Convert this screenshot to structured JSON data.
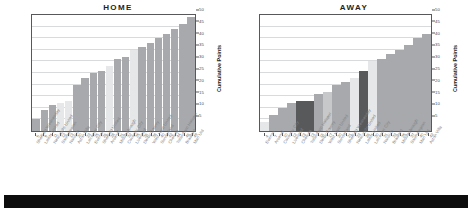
{
  "charts": {
    "home": {
      "title": "HOME",
      "ylabel": "Cumulative Points"
    },
    "away": {
      "title": "AWAY",
      "ylabel": "Cumulative Points"
    }
  },
  "chart_data": [
    {
      "type": "bar",
      "title": "HOME",
      "xlabel": "",
      "ylabel": "Cumulative Points",
      "ylim": [
        0,
        50
      ],
      "yticks": [
        5,
        10,
        15,
        20,
        25,
        30,
        35,
        40,
        45,
        50
      ],
      "grid": true,
      "legend": "none",
      "categories": [
        "Sheffield Wednesday",
        "Leeds United",
        "Newcastle United",
        "Southampton",
        "Norwich",
        "Aston Villa",
        "Leicester City",
        "Everton",
        "Sheffield United",
        "Arsenal",
        "Middlesbrough",
        "Coventry City",
        "Liverpool",
        "Derby County",
        "West Ham United",
        "Sunderland",
        "Chelsea",
        "Tottenham Hotspur",
        "Bradford",
        "Man Utd"
      ],
      "values": [
        5,
        9,
        11,
        12,
        13,
        20,
        23,
        25,
        26,
        28,
        31,
        32,
        35,
        36,
        38,
        40,
        42,
        44,
        46,
        49
      ],
      "bar_colors": [
        "#a7a9ac",
        "#a7a9ac",
        "#a7a9ac",
        "#e6e7e8",
        "#e6e7e8",
        "#a7a9ac",
        "#a7a9ac",
        "#a7a9ac",
        "#a7a9ac",
        "#e6e7e8",
        "#a7a9ac",
        "#a7a9ac",
        "#e6e7e8",
        "#a7a9ac",
        "#a7a9ac",
        "#a7a9ac",
        "#a7a9ac",
        "#a7a9ac",
        "#a7a9ac",
        "#a7a9ac"
      ]
    },
    {
      "type": "bar",
      "title": "AWAY",
      "xlabel": "",
      "ylabel": "Cumulative Points",
      "ylim": [
        0,
        50
      ],
      "yticks": [
        5,
        10,
        15,
        20,
        25,
        30,
        35,
        40,
        45,
        50
      ],
      "grid": true,
      "legend": "none",
      "categories": [
        "Everton",
        "Arsenal",
        "Coventry City",
        "Liverpool",
        "Chelsea",
        "Tottenham Hotspur",
        "Derby County",
        "West Ham United",
        "Sunderland",
        "Sheffield Wednesday",
        "Newcastle United",
        "Leeds United",
        "Leicester City",
        "Norwich",
        "Bradford",
        "Middlesbrough",
        "Southampton",
        "Man Utd",
        "Aston Villa"
      ],
      "values": [
        4,
        7,
        10,
        12,
        13,
        13,
        16,
        17,
        20,
        21,
        23,
        26,
        30,
        31,
        33,
        35,
        37,
        40,
        42
      ],
      "bar_colors": [
        "#e6e7e8",
        "#a7a9ac",
        "#a7a9ac",
        "#a7a9ac",
        "#58595b",
        "#58595b",
        "#a7a9ac",
        "#c7c8ca",
        "#a7a9ac",
        "#a7a9ac",
        "#e6e7e8",
        "#58595b",
        "#e6e7e8",
        "#a7a9ac",
        "#a7a9ac",
        "#a7a9ac",
        "#a7a9ac",
        "#a7a9ac",
        "#a7a9ac"
      ]
    }
  ],
  "footer": {
    "label": "footer-band"
  }
}
